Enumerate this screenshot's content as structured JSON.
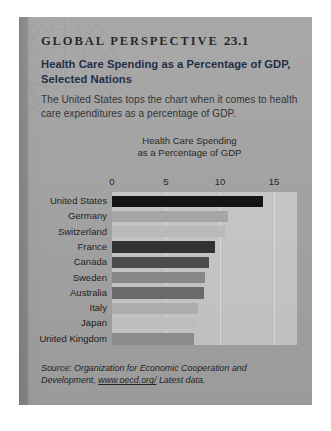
{
  "header": {
    "kicker_text": "GLOBAL PERSPECTIVE",
    "kicker_number": "23.1",
    "title": "Health Care Spending as a Percentage of GDP, Selected Nations",
    "intro": "The United States tops the chart when it comes to health care expenditures as a percentage of GDP."
  },
  "source": {
    "label": "Source:",
    "text": "Organization for Economic Cooperation and Development,",
    "url": "www.oecd.org/",
    "note": "Latest data."
  },
  "chart_data": {
    "type": "bar",
    "orientation": "horizontal",
    "title": "Health Care Spending as a Percentage of GDP",
    "title_line1": "Health Care Spending",
    "title_line2": "as a Percentage of GDP",
    "xlabel": "",
    "ylabel": "",
    "xlim": [
      0,
      15
    ],
    "ticks": [
      0,
      5,
      10,
      15
    ],
    "tick_labels": [
      "0",
      "5",
      "10",
      "15"
    ],
    "grid": true,
    "legend": false,
    "categories": [
      "United States",
      "Germany",
      "Switzerland",
      "France",
      "Canada",
      "Sweden",
      "Australia",
      "Italy",
      "Japan",
      "United Kingdom"
    ],
    "values": [
      14.0,
      10.7,
      10.5,
      9.5,
      9.0,
      8.6,
      8.5,
      8.0,
      7.8,
      7.6
    ],
    "bar_colors": [
      "#0d0d0d",
      "#a8a8a8",
      "#bdbdbd",
      "#2e2e2e",
      "#4a4a4a",
      "#8a8a8a",
      "#6b6b6b",
      "#b2b2b2",
      "#c4c4c4",
      "#909090"
    ]
  },
  "colors": {
    "panel_background": "#a3a3a3",
    "plot_background": "#c8c8c8",
    "gridline": "#dedede",
    "title_text": "#15233c",
    "body_text": "#2b2b2b"
  }
}
